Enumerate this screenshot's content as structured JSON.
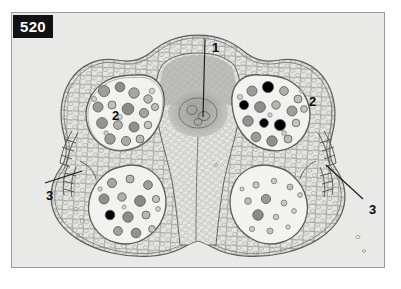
{
  "plate": {
    "number": "520",
    "background_color": "#e9e9e7",
    "frame_color": "#9a9a98",
    "badge_color": "#111111",
    "badge_text_color": "#ffffff",
    "ink_color": "#6c6c6c"
  },
  "labels": [
    {
      "id": "label-1",
      "text": "1",
      "x": 200,
      "y": 28,
      "leader": "vertical-down"
    },
    {
      "id": "label-2-left",
      "text": "2",
      "x": 100,
      "y": 96,
      "leader": "none"
    },
    {
      "id": "label-2-right",
      "text": "2",
      "x": 297,
      "y": 82,
      "leader": "none"
    },
    {
      "id": "label-3-left",
      "text": "3",
      "x": 34,
      "y": 176,
      "leader": "diagonal-up-right"
    },
    {
      "id": "label-3-right",
      "text": "3",
      "x": 357,
      "y": 190,
      "leader": "diagonal-up-left"
    }
  ]
}
